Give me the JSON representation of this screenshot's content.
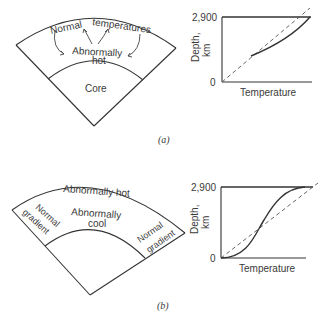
{
  "figure_a": {
    "label": "(a)",
    "cross_section": {
      "labels": {
        "normal": "Normal",
        "temperatures": "temperatures",
        "abnormally": "Abnormally",
        "hot": "hot",
        "core": "Core"
      }
    },
    "graph": {
      "y_axis_label_1": "Depth,",
      "y_axis_label_2": "km",
      "y_tick_top": "2,900",
      "y_tick_bottom": "0",
      "x_axis_label": "Temperature"
    }
  },
  "figure_b": {
    "label": "(b)",
    "cross_section": {
      "labels": {
        "abnormally_hot": "Abnormally hot",
        "normal_left_1": "Normal",
        "normal_left_2": "gradient",
        "abnormally": "Abnormally",
        "cool": "cool",
        "normal_right_1": "Normal",
        "normal_right_2": "gradient"
      }
    },
    "graph": {
      "y_axis_label_1": "Depth,",
      "y_axis_label_2": "km",
      "y_tick_top": "2,900",
      "y_tick_bottom": "0",
      "x_axis_label": "Temperature"
    }
  },
  "colors": {
    "line": "#333333",
    "dashed": "#555555",
    "text": "#3a3a3a",
    "background": "#ffffff"
  }
}
